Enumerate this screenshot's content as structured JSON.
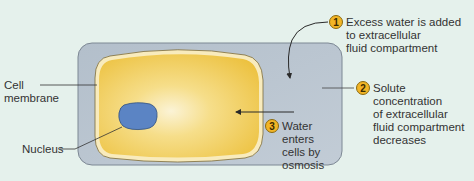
{
  "diagram": {
    "colors": {
      "background": "#e5f1ec",
      "extracellular_fluid": "#b8c3ce",
      "cell_cytoplasm": "#f0c84a",
      "cell_membrane": "#f7e8b8",
      "nucleus": "#5b84c4",
      "badge": "#f2b526"
    },
    "labels": {
      "cell_membrane": "Cell\nmembrane",
      "nucleus": "Nucleus"
    },
    "steps": [
      {
        "number": "1",
        "text": "Excess water is added\nto extracellular\nfluid compartment"
      },
      {
        "number": "2",
        "text": "Solute\nconcentration\nof extracellular\nfluid compartment\ndecreases"
      },
      {
        "number": "3",
        "text": "Water\nenters\ncells by\nosmosis"
      }
    ]
  }
}
